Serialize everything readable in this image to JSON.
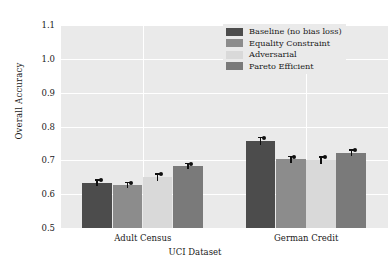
{
  "chart_data": {
    "type": "bar",
    "title": "",
    "xlabel": "UCI Dataset",
    "ylabel": "Overall Accuracy",
    "categories": [
      "Adult Census",
      "German Credit"
    ],
    "ylim": [
      0.5,
      1.1
    ],
    "yticks": [
      "0.5",
      "0.6",
      "0.7",
      "0.8",
      "0.9",
      "1.0",
      "1.1"
    ],
    "ytick_values": [
      0.5,
      0.6,
      0.7,
      0.8,
      0.9,
      1.0,
      1.1
    ],
    "grid": true,
    "grid_axis": "both",
    "legend_position": "upper right",
    "series": [
      {
        "name": "Baseline (no bias loss)",
        "color": "#4c4c4c",
        "values": [
          0.634,
          0.757
        ],
        "errors": [
          0.011,
          0.013
        ]
      },
      {
        "name": "Equality Constraint",
        "color": "#8c8c8c",
        "values": [
          0.627,
          0.703
        ],
        "errors": [
          0.01,
          0.011
        ]
      },
      {
        "name": "Adversarial",
        "color": "#d9d9d9",
        "values": [
          0.65,
          0.7
        ],
        "errors": [
          0.012,
          0.012
        ]
      },
      {
        "name": "Pareto Efficient",
        "color": "#7a7a7a",
        "values": [
          0.684,
          0.723
        ],
        "errors": [
          0.009,
          0.01
        ]
      }
    ]
  },
  "axes": {
    "plot_background": "#eaeaea",
    "gridline_color": "#ffffff"
  }
}
